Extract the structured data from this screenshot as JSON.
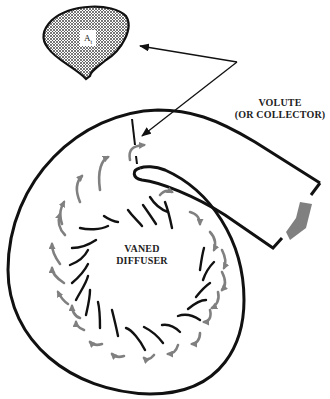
{
  "diagram": {
    "labels": {
      "volute_line1": "VOLUTE",
      "volute_line2": "(OR COLLECTOR)",
      "diffuser_line1": "VANED",
      "diffuser_line2": "DIFFUSER",
      "area_symbol": "A",
      "area_subscript": "t"
    },
    "colors": {
      "stroke": "#111111",
      "flow_arrow": "#808080",
      "hatch": "#444444",
      "background": "#ffffff"
    },
    "vane_count": 21
  }
}
